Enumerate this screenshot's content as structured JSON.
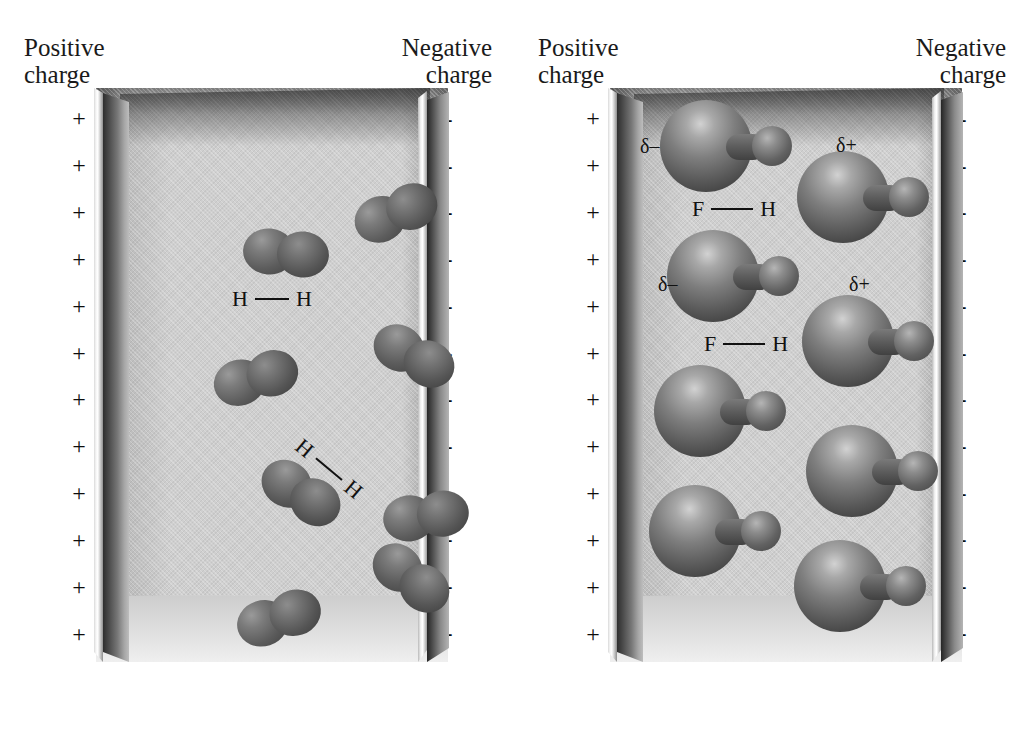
{
  "figure": {
    "type": "diagram"
  },
  "panels": [
    {
      "id": "nonpolar",
      "positive_label": "Positive\ncharge",
      "negative_label": "Negative\ncharge",
      "positive_symbol": "+",
      "negative_symbol": "–",
      "charge_count": 12,
      "molecule": {
        "name": "H2",
        "type": "nonpolar-diatomic",
        "count": 8,
        "bond_label": {
          "left_atom": "H",
          "right_atom": "H"
        }
      },
      "bond_labels": [
        {
          "left_atom": "H",
          "right_atom": "H",
          "rotation": 0
        },
        {
          "left_atom": "H",
          "right_atom": "H",
          "rotation": 40
        }
      ],
      "molecules": [
        {
          "x": 190,
          "y": 165,
          "rot": 5
        },
        {
          "x": 300,
          "y": 125,
          "rot": -22
        },
        {
          "x": 160,
          "y": 290,
          "rot": -16
        },
        {
          "x": 318,
          "y": 268,
          "rot": 28
        },
        {
          "x": 205,
          "y": 405,
          "rot": 33
        },
        {
          "x": 330,
          "y": 428,
          "rot": -8
        },
        {
          "x": 183,
          "y": 530,
          "rot": -18
        },
        {
          "x": 315,
          "y": 590,
          "rot": 38
        }
      ]
    },
    {
      "id": "polar",
      "positive_label": "Positive\ncharge",
      "negative_label": "Negative\ncharge",
      "positive_symbol": "+",
      "negative_symbol": "–",
      "charge_count": 12,
      "molecule": {
        "name": "HF",
        "type": "polar-diatomic",
        "count": 8,
        "bond_label": {
          "left_atom": "F",
          "right_atom": "H"
        }
      },
      "bond_labels": [
        {
          "left_atom": "F",
          "right_atom": "H"
        },
        {
          "left_atom": "F",
          "right_atom": "H"
        }
      ],
      "partial_charges": [
        {
          "symbol": "δ–",
          "pole": "negative-end-F"
        },
        {
          "symbol": "δ+",
          "pole": "positive-end-H"
        },
        {
          "symbol": "δ–",
          "pole": "negative-end-F"
        },
        {
          "symbol": "δ+",
          "pole": "positive-end-H"
        }
      ],
      "molecules": [
        {
          "x": 116,
          "y": 105
        },
        {
          "x": 253,
          "y": 155
        },
        {
          "x": 123,
          "y": 235
        },
        {
          "x": 258,
          "y": 300
        },
        {
          "x": 110,
          "y": 370
        },
        {
          "x": 262,
          "y": 430
        },
        {
          "x": 105,
          "y": 490
        },
        {
          "x": 250,
          "y": 545
        }
      ]
    }
  ],
  "colors": {
    "background": "#ffffff",
    "chamber_fill": "#cfcfcf",
    "plate_dark": "#3a3a3a",
    "plate_highlight": "#ffffff",
    "molecule_dark": "#3d3d3d",
    "molecule_highlight": "#d2d2d2",
    "text": "#111111"
  }
}
